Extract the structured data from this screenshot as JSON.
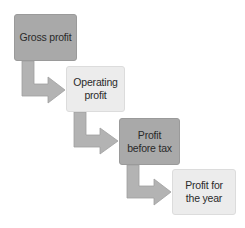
{
  "diagram": {
    "type": "stepped-flow",
    "steps": [
      {
        "label": "Gross profit",
        "style": "dark"
      },
      {
        "label": "Operating\nprofit",
        "style": "light"
      },
      {
        "label": "Profit\nbefore tax",
        "style": "dark"
      },
      {
        "label": "Profit for\nthe year",
        "style": "light"
      }
    ],
    "colors": {
      "dark_box": "#a9a9a9",
      "light_box": "#ececec",
      "arrow": "#b3b3b3",
      "arrow_stroke": "#9d9d9d",
      "text": "#2a2a2a"
    }
  }
}
